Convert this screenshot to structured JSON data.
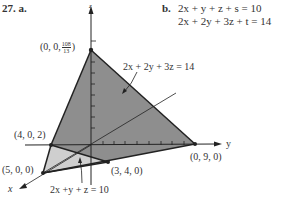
{
  "problem": {
    "number": "27.",
    "part_a": "a.",
    "part_b": "b."
  },
  "equations_b": [
    "2x + y + z + s = 10",
    "2x + 2y + 3z + t = 14"
  ],
  "axes": {
    "x": "x",
    "y": "y",
    "z": "z"
  },
  "points": {
    "apex_prefix": "(0, 0,",
    "apex_num": "108",
    "apex_den": "13",
    "apex_suffix": ")",
    "p402": "(4, 0, 2)",
    "p500": "(5, 0, 0)",
    "p340": "(3, 4, 0)",
    "p090": "(0, 9, 0)"
  },
  "plane_labels": {
    "plane1": "2x + 2y + 3z = 14",
    "plane2": "2x +y + z = 10"
  },
  "colors": {
    "dark_face": "#8e8e8e",
    "light_face": "#cfcfcf",
    "line": "#222222"
  }
}
